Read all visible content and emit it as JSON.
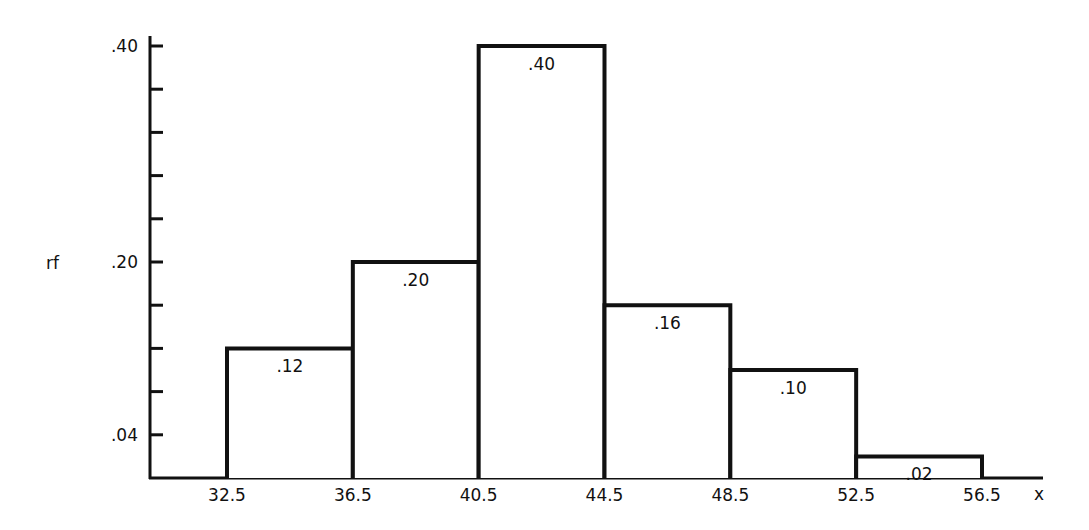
{
  "chart_data": {
    "type": "bar",
    "subtype": "histogram",
    "title": "",
    "xlabel": "x",
    "ylabel": "rf",
    "bin_edges": [
      32.5,
      36.5,
      40.5,
      44.5,
      48.5,
      52.5,
      56.5
    ],
    "categories": [
      "32.5-36.5",
      "36.5-40.5",
      "40.5-44.5",
      "44.5-48.5",
      "48.5-52.5",
      "52.5-56.5"
    ],
    "values": [
      0.12,
      0.2,
      0.4,
      0.16,
      0.1,
      0.02
    ],
    "bar_labels": [
      ".12",
      ".20",
      ".40",
      ".16",
      ".10",
      ".02"
    ],
    "x_tick_labels": [
      "32.5",
      "36.5",
      "40.5",
      "44.5",
      "48.5",
      "52.5",
      "56.5"
    ],
    "y_tick_labels": [
      ".04",
      ".20",
      ".40"
    ],
    "y_tick_values": [
      0.04,
      0.2,
      0.4
    ],
    "y_minor_tick_step": 0.04,
    "ylim": [
      0,
      0.4
    ],
    "grid": false,
    "legend": null,
    "colors": {
      "stroke": "#111111",
      "fill": "#ffffff"
    }
  }
}
